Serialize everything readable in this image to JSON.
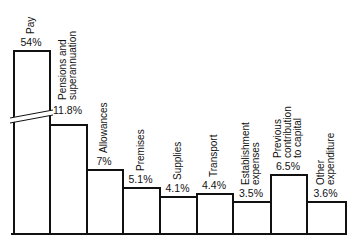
{
  "chart_data": {
    "type": "bar",
    "title": "",
    "xlabel": "",
    "ylabel": "",
    "axis_break": "broken axis on Pay bar",
    "grid": false,
    "legend": null,
    "categories": [
      "Pay",
      "Pensions and superannuation",
      "Allowances",
      "Premises",
      "Supplies",
      "Transport",
      "Establishment expenses",
      "Previous contribution to capital",
      "Other expenditure"
    ],
    "values": [
      54,
      11.8,
      7,
      5.1,
      4.1,
      4.4,
      3.5,
      6.5,
      3.6
    ],
    "value_labels": [
      "54%",
      "11.8%",
      "7%",
      "5.1%",
      "4.1%",
      "4.4%",
      "3.5%",
      "6.5%",
      "3.6%"
    ],
    "label_lines": [
      [
        "Pay"
      ],
      [
        "Pensions and",
        "superannuation"
      ],
      [
        "Allowances"
      ],
      [
        "Premises"
      ],
      [
        "Supplies"
      ],
      [
        "Transport"
      ],
      [
        "Establishment",
        "expenses"
      ],
      [
        "Previous",
        "contribution",
        "to capital"
      ],
      [
        "Other",
        "expenditure"
      ]
    ],
    "unit": "%"
  }
}
